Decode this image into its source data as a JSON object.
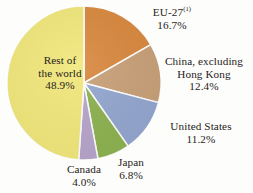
{
  "chart_data": {
    "type": "pie",
    "title": "",
    "subtitle": "",
    "xlabel": "",
    "ylabel": "",
    "legend_position": "none",
    "grid": false,
    "categories": [
      "EU-27",
      "China, excluding Hong Kong",
      "United States",
      "Japan",
      "Canada",
      "Rest of the world"
    ],
    "values": [
      16.7,
      12.4,
      11.2,
      6.8,
      4.0,
      48.9
    ],
    "value_labels": [
      "16.7%",
      "12.4%",
      "11.2%",
      "6.8%",
      "4.0%",
      "48.9%"
    ],
    "units": "percent",
    "colors": [
      "#d9883d",
      "#c8a077",
      "#93a6cf",
      "#8db24f",
      "#b7a5cb",
      "#f2e87b"
    ],
    "annotations": [
      "(1)"
    ],
    "slices": [
      {
        "id": "eu27",
        "name": "EU-27",
        "footnote": "(1)",
        "percent_label": "16.7%",
        "value": 16.7,
        "color": "#d9883d"
      },
      {
        "id": "china",
        "name_line1": "China, excluding",
        "name_line2": "Hong Kong",
        "name": "China, excluding Hong Kong",
        "percent_label": "12.4%",
        "value": 12.4,
        "color": "#c8a077"
      },
      {
        "id": "united-states",
        "name": "United States",
        "percent_label": "11.2%",
        "value": 11.2,
        "color": "#93a6cf"
      },
      {
        "id": "japan",
        "name": "Japan",
        "percent_label": "6.8%",
        "value": 6.8,
        "color": "#8db24f"
      },
      {
        "id": "canada",
        "name": "Canada",
        "percent_label": "4.0%",
        "value": 4.0,
        "color": "#b7a5cb"
      },
      {
        "id": "rest-of-world",
        "name_line1": "Rest of",
        "name_line2": "the world",
        "name": "Rest of the world",
        "percent_label": "48.9%",
        "value": 48.9,
        "color": "#f2e87b"
      }
    ],
    "background_color": "#fdfdfb",
    "text_color": "#262220",
    "separator_color": "#ffffff"
  }
}
